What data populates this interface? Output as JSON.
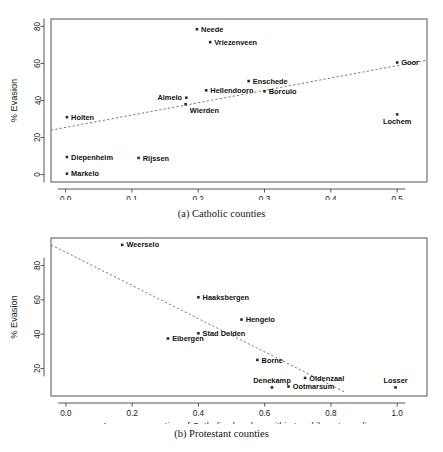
{
  "figure": {
    "axis_title": "Average proportion of Catholic churches within two-kilometer radius",
    "ylabel": "% Evasion"
  },
  "chart_data": [
    {
      "type": "scatter",
      "title": "(a) Catholic counties",
      "xlabel": "Average proportion of Catholic churches within two-kilometer radius",
      "ylabel": "% Evasion",
      "xlim": [
        -0.022,
        0.545
      ],
      "ylim": [
        -4,
        84
      ],
      "xticks": [
        0.0,
        0.1,
        0.2,
        0.3,
        0.4,
        0.5
      ],
      "xticklabels": [
        "0.0",
        "0.1",
        "0.2",
        "0.3",
        "0.4",
        "0.5"
      ],
      "yticks": [
        0,
        20,
        40,
        60,
        80
      ],
      "yticklabels": [
        "0",
        "20",
        "40",
        "60",
        "80"
      ],
      "grid": false,
      "legend": false,
      "trendline": {
        "style": "dashed",
        "x0": -0.022,
        "y0": 24.0,
        "x1": 0.545,
        "y1": 61.8
      },
      "points": [
        {
          "label": "Neede",
          "x": 0.198,
          "y": 78.5,
          "label_pos": "right"
        },
        {
          "label": "Vriezenveen",
          "x": 0.218,
          "y": 71.5,
          "label_pos": "right"
        },
        {
          "label": "Goor",
          "x": 0.5,
          "y": 60.5,
          "label_pos": "right"
        },
        {
          "label": "Enschede",
          "x": 0.276,
          "y": 50.5,
          "label_pos": "right"
        },
        {
          "label": "Hellendoorn",
          "x": 0.212,
          "y": 45.5,
          "label_pos": "right"
        },
        {
          "label": "Borculo",
          "x": 0.3,
          "y": 45.0,
          "label_pos": "right"
        },
        {
          "label": "Almelo",
          "x": 0.182,
          "y": 41.5,
          "label_pos": "left"
        },
        {
          "label": "Wierden",
          "x": 0.181,
          "y": 38.0,
          "label_pos": "right-below"
        },
        {
          "label": "Lochem",
          "x": 0.5,
          "y": 32.5,
          "label_pos": "below"
        },
        {
          "label": "Holten",
          "x": 0.002,
          "y": 31.0,
          "label_pos": "right"
        },
        {
          "label": "Diepenheim",
          "x": 0.002,
          "y": 9.5,
          "label_pos": "right"
        },
        {
          "label": "Rijssen",
          "x": 0.11,
          "y": 9.0,
          "label_pos": "right"
        },
        {
          "label": "Markelo",
          "x": 0.002,
          "y": 0.5,
          "label_pos": "right"
        }
      ]
    },
    {
      "type": "scatter",
      "title": "(b) Protestant counties",
      "xlabel": "Average proportion of Catholic churches within two-kilometer radius",
      "ylabel": "% Evasion",
      "xlim": [
        -0.045,
        1.09
      ],
      "ylim": [
        4,
        96
      ],
      "xticks": [
        0.0,
        0.2,
        0.4,
        0.6,
        0.8,
        1.0
      ],
      "xticklabels": [
        "0.0",
        "0.2",
        "0.4",
        "0.6",
        "0.8",
        "1.0"
      ],
      "yticks": [
        20,
        40,
        60,
        80
      ],
      "yticklabels": [
        "20",
        "40",
        "60",
        "80"
      ],
      "grid": false,
      "legend": false,
      "trendline": {
        "style": "dashed",
        "x0": -0.045,
        "y0": 92.0,
        "x1": 0.845,
        "y1": 6.0
      },
      "points": [
        {
          "label": "Weerselo",
          "x": 0.17,
          "y": 92.0,
          "label_pos": "right"
        },
        {
          "label": "Haaksbergen",
          "x": 0.4,
          "y": 61.5,
          "label_pos": "right"
        },
        {
          "label": "Hengelo",
          "x": 0.53,
          "y": 48.5,
          "label_pos": "right"
        },
        {
          "label": "Stad Delden",
          "x": 0.4,
          "y": 40.5,
          "label_pos": "right"
        },
        {
          "label": "Eibergen",
          "x": 0.308,
          "y": 37.5,
          "label_pos": "right"
        },
        {
          "label": "Borne",
          "x": 0.578,
          "y": 25.0,
          "label_pos": "right"
        },
        {
          "label": "Oldenzaal",
          "x": 0.722,
          "y": 14.5,
          "label_pos": "right"
        },
        {
          "label": "Denekamp",
          "x": 0.622,
          "y": 9.0,
          "label_pos": "above"
        },
        {
          "label": "Ootmarsum",
          "x": 0.672,
          "y": 9.5,
          "label_pos": "right"
        },
        {
          "label": "Losser",
          "x": 0.995,
          "y": 9.0,
          "label_pos": "above"
        }
      ]
    }
  ]
}
